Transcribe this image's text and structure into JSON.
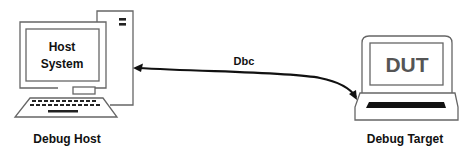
{
  "diagram": {
    "host": {
      "screen_line1": "Host",
      "screen_line2": "System",
      "caption": "Debug Host"
    },
    "target": {
      "screen_text": "DUT",
      "caption": "Debug Target"
    },
    "connection": {
      "label": "Dbc",
      "direction": "bidirectional"
    },
    "colors": {
      "stroke": "#555555",
      "text": "#111111",
      "dut_text": "#555555",
      "arrow": "#111111",
      "background": "#ffffff"
    }
  }
}
